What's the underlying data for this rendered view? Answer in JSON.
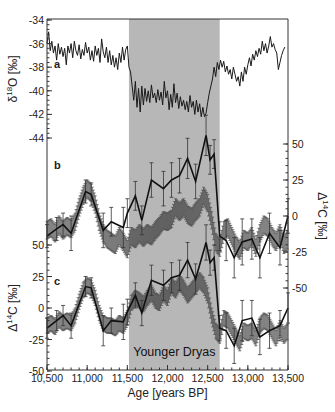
{
  "chart_data": {
    "type": "line",
    "title": "",
    "xlabel": "Age [years BP]",
    "xlim": [
      10500,
      13500
    ],
    "x_ticks": [
      10500,
      11000,
      11500,
      12000,
      12500,
      13000,
      13500
    ],
    "x_tick_labels": [
      "10,500",
      "11,000",
      "11,500",
      "12,000",
      "12,500",
      "13,000",
      "13,500"
    ],
    "shaded_region": {
      "label": "Younger Dryas",
      "x_range": [
        11520,
        12650
      ],
      "color": "#b7b7b7"
    },
    "panels": [
      {
        "id": "a",
        "label": "a",
        "ylabel_prefix": "δ",
        "ylabel_sup": "18",
        "ylabel_suffix": "O [‰]",
        "axis_side": "left",
        "ylim": [
          -44,
          -34
        ],
        "y_ticks": [
          -34,
          -36,
          -38,
          -40,
          -42,
          -44
        ],
        "series": [
          {
            "name": "delta18O",
            "color": "#1a1a1a",
            "x": [
              10500,
              10520,
              10540,
              10560,
              10580,
              10600,
              10620,
              10640,
              10660,
              10680,
              10700,
              10720,
              10740,
              10760,
              10780,
              10800,
              10820,
              10840,
              10860,
              10880,
              10900,
              10920,
              10940,
              10960,
              10980,
              11000,
              11020,
              11040,
              11060,
              11080,
              11100,
              11120,
              11140,
              11160,
              11180,
              11200,
              11220,
              11240,
              11260,
              11280,
              11300,
              11320,
              11340,
              11360,
              11380,
              11400,
              11420,
              11440,
              11460,
              11480,
              11500,
              11520,
              11540,
              11560,
              11580,
              11600,
              11620,
              11640,
              11660,
              11680,
              11700,
              11720,
              11740,
              11760,
              11780,
              11800,
              11820,
              11840,
              11860,
              11880,
              11900,
              11920,
              11940,
              11960,
              11980,
              12000,
              12020,
              12040,
              12060,
              12080,
              12100,
              12120,
              12140,
              12160,
              12180,
              12200,
              12220,
              12240,
              12260,
              12280,
              12300,
              12320,
              12340,
              12360,
              12380,
              12400,
              12420,
              12440,
              12460,
              12480,
              12500,
              12520,
              12540,
              12560,
              12580,
              12600,
              12620,
              12640,
              12660,
              12680,
              12700,
              12720,
              12740,
              12760,
              12780,
              12800,
              12820,
              12840,
              12860,
              12880,
              12900,
              12920,
              12940,
              12960,
              12980,
              13000,
              13020,
              13040,
              13060,
              13080,
              13100,
              13120,
              13140,
              13160,
              13180,
              13200,
              13220,
              13240,
              13260,
              13280,
              13300,
              13320,
              13340,
              13360,
              13380,
              13400,
              13420,
              13440,
              13460,
              13480,
              13500
            ],
            "values": [
              -36.0,
              -35.0,
              -36.6,
              -35.8,
              -36.8,
              -36.2,
              -37.4,
              -36.0,
              -36.9,
              -36.3,
              -37.1,
              -36.4,
              -37.8,
              -36.2,
              -36.8,
              -36.0,
              -37.2,
              -35.8,
              -36.6,
              -37.0,
              -36.1,
              -37.3,
              -36.5,
              -37.0,
              -35.9,
              -36.8,
              -36.3,
              -37.4,
              -36.6,
              -37.5,
              -36.2,
              -37.0,
              -36.4,
              -37.6,
              -35.6,
              -36.7,
              -37.2,
              -36.3,
              -37.6,
              -36.6,
              -37.8,
              -37.0,
              -38.0,
              -37.2,
              -38.2,
              -36.8,
              -37.6,
              -36.3,
              -37.4,
              -36.5,
              -36.2,
              -38.0,
              -38.4,
              -39.6,
              -40.8,
              -39.2,
              -41.4,
              -39.8,
              -41.8,
              -39.6,
              -41.2,
              -39.8,
              -40.9,
              -40.0,
              -41.0,
              -39.5,
              -40.6,
              -40.2,
              -41.0,
              -39.9,
              -40.8,
              -40.1,
              -41.2,
              -39.2,
              -40.6,
              -40.0,
              -41.6,
              -40.3,
              -41.4,
              -39.4,
              -41.0,
              -40.2,
              -41.5,
              -40.5,
              -41.3,
              -40.8,
              -41.6,
              -40.9,
              -41.8,
              -40.4,
              -41.4,
              -40.9,
              -42.0,
              -40.8,
              -41.8,
              -41.1,
              -42.2,
              -41.4,
              -42.2,
              -41.9,
              -41.0,
              -40.2,
              -39.6,
              -39.0,
              -38.0,
              -38.8,
              -37.6,
              -38.2,
              -37.4,
              -38.0,
              -37.5,
              -38.4,
              -37.9,
              -38.6,
              -38.2,
              -39.0,
              -38.0,
              -38.6,
              -39.2,
              -38.8,
              -39.6,
              -38.4,
              -39.2,
              -38.0,
              -38.6,
              -37.8,
              -37.2,
              -37.9,
              -36.9,
              -37.4,
              -36.6,
              -37.1,
              -36.4,
              -36.9,
              -35.8,
              -36.6,
              -36.0,
              -36.8,
              -36.2,
              -35.4,
              -36.3,
              -36.0,
              -36.5,
              -36.8,
              -38.2,
              -37.6,
              -37.0,
              -36.6,
              -36.3
            ]
          }
        ]
      },
      {
        "id": "b",
        "label": "b",
        "ylabel_prefix": "Δ",
        "ylabel_sup": "14",
        "ylabel_suffix": "C [‰]",
        "axis_side": "right",
        "ylim": [
          -50,
          50
        ],
        "y_ticks": [
          50,
          25,
          0,
          -25,
          -50
        ],
        "series": [
          {
            "name": "model-band",
            "style": "dense-error-band",
            "color": "#555555",
            "x": [
              10500,
              10550,
              10600,
              10650,
              10700,
              10750,
              10800,
              10850,
              10900,
              10950,
              11000,
              11050,
              11100,
              11150,
              11200,
              11250,
              11300,
              11350,
              11400,
              11450,
              11500,
              11550,
              11600,
              11650,
              11700,
              11750,
              11800,
              11850,
              11900,
              11950,
              12000,
              12050,
              12100,
              12150,
              12200,
              12250,
              12300,
              12350,
              12400,
              12450,
              12500,
              12550,
              12600,
              12650,
              12700,
              12750,
              12800,
              12850,
              12900,
              12950,
              13000,
              13050,
              13100,
              13150,
              13200,
              13250,
              13300,
              13350,
              13400,
              13450,
              13500
            ],
            "values": [
              -10,
              -8,
              -12,
              -6,
              -10,
              -7,
              -9,
              -4,
              6,
              14,
              19,
              16,
              8,
              -4,
              -12,
              -16,
              -18,
              -20,
              -14,
              -18,
              -23,
              -14,
              -16,
              -12,
              -15,
              -12,
              -14,
              -10,
              -7,
              -3,
              -4,
              -2,
              6,
              3,
              6,
              1,
              -1,
              3,
              6,
              14,
              9,
              -3,
              -18,
              -22,
              -10,
              -8,
              -14,
              -20,
              -24,
              -16,
              -18,
              -14,
              -22,
              -12,
              -6,
              -8,
              -14,
              -18,
              -12,
              -20,
              -16
            ],
            "errors": [
              6,
              6,
              6,
              6,
              6,
              6,
              6,
              6,
              6,
              6,
              6,
              6,
              6,
              6,
              6,
              6,
              6,
              6,
              6,
              6,
              6,
              6,
              6,
              6,
              6,
              6,
              6,
              6,
              6,
              6,
              6,
              6,
              6,
              6,
              6,
              6,
              6,
              6,
              6,
              6,
              6,
              6,
              6,
              6,
              6,
              6,
              6,
              6,
              6,
              6,
              6,
              6,
              6,
              6,
              6,
              6,
              6,
              6,
              6,
              6,
              6
            ]
          },
          {
            "name": "measured",
            "style": "line-with-errorbars",
            "color": "#111111",
            "x": [
              10500,
              10620,
              10700,
              10800,
              10980,
              11050,
              11200,
              11300,
              11450,
              11500,
              11600,
              11680,
              11800,
              11950,
              12050,
              12150,
              12250,
              12350,
              12480,
              12530,
              12580,
              12650,
              12730,
              12830,
              12930,
              13050,
              13150,
              13270,
              13400,
              13500
            ],
            "values": [
              -14,
              -9,
              -6,
              -12,
              17,
              15,
              -10,
              -4,
              -8,
              2,
              14,
              -3,
              25,
              19,
              25,
              28,
              40,
              24,
              56,
              39,
              43,
              -14,
              -17,
              -29,
              -18,
              -16,
              -29,
              -12,
              -22,
              0
            ],
            "errors": [
              8,
              8,
              8,
              12,
              8,
              8,
              12,
              10,
              14,
              10,
              10,
              10,
              12,
              12,
              12,
              12,
              14,
              12,
              14,
              10,
              10,
              10,
              14,
              14,
              16,
              14,
              14,
              14,
              12,
              12
            ]
          }
        ]
      },
      {
        "id": "c",
        "label": "c",
        "ylabel_prefix": "Δ",
        "ylabel_sup": "14",
        "ylabel_suffix": "C [‰]",
        "axis_side": "left",
        "ylim": [
          -50,
          50
        ],
        "y_ticks": [
          50,
          25,
          0,
          -25,
          -50
        ],
        "series": [
          {
            "name": "model-band",
            "style": "dense-error-band",
            "color": "#555555",
            "x": [
              10500,
              10550,
              10600,
              10650,
              10700,
              10750,
              10800,
              10850,
              10900,
              10950,
              11000,
              11050,
              11100,
              11150,
              11200,
              11250,
              11300,
              11350,
              11400,
              11450,
              11500,
              11550,
              11600,
              11650,
              11700,
              11750,
              11800,
              11850,
              11900,
              11950,
              12000,
              12050,
              12100,
              12150,
              12200,
              12250,
              12300,
              12350,
              12400,
              12450,
              12500,
              12550,
              12600,
              12650,
              12700,
              12750,
              12800,
              12850,
              12900,
              12950,
              13000,
              13050,
              13100,
              13150,
              13200,
              13250,
              13300,
              13350,
              13400,
              13450,
              13500
            ],
            "values": [
              -14,
              -12,
              -15,
              -9,
              -12,
              -10,
              -12,
              -6,
              5,
              14,
              18,
              16,
              8,
              -4,
              -12,
              -14,
              -14,
              -16,
              -12,
              -14,
              -8,
              4,
              8,
              6,
              3,
              8,
              12,
              6,
              4,
              12,
              8,
              18,
              14,
              20,
              16,
              10,
              14,
              18,
              22,
              18,
              10,
              -6,
              -18,
              -22,
              -8,
              -10,
              -16,
              -22,
              -28,
              -18,
              -20,
              -18,
              -24,
              -14,
              -10,
              -12,
              -18,
              -24,
              -16,
              -22,
              -18
            ],
            "errors": [
              6,
              6,
              6,
              6,
              6,
              6,
              6,
              6,
              6,
              6,
              6,
              6,
              6,
              6,
              6,
              6,
              6,
              6,
              6,
              6,
              6,
              6,
              6,
              6,
              6,
              6,
              6,
              6,
              6,
              6,
              6,
              6,
              6,
              6,
              6,
              6,
              6,
              6,
              6,
              6,
              6,
              6,
              6,
              6,
              6,
              6,
              6,
              6,
              6,
              6,
              6,
              6,
              6,
              6,
              6,
              6,
              6,
              6,
              6,
              6,
              6
            ]
          },
          {
            "name": "measured",
            "style": "line-with-errorbars",
            "color": "#111111",
            "x": [
              10500,
              10620,
              10700,
              10800,
              10980,
              11050,
              11200,
              11300,
              11450,
              11500,
              11600,
              11680,
              11800,
              11950,
              12050,
              12150,
              12250,
              12350,
              12480,
              12530,
              12580,
              12650,
              12730,
              12830,
              12930,
              13050,
              13150,
              13270,
              13400,
              13500
            ],
            "values": [
              -16,
              -10,
              -6,
              -14,
              17,
              16,
              -18,
              -10,
              -11,
              -3,
              10,
              -4,
              22,
              18,
              24,
              26,
              38,
              23,
              52,
              36,
              40,
              -16,
              -18,
              -30,
              -10,
              -8,
              -23,
              -18,
              -14,
              0
            ],
            "errors": [
              8,
              8,
              8,
              10,
              8,
              8,
              12,
              10,
              14,
              10,
              10,
              10,
              12,
              12,
              12,
              12,
              14,
              12,
              14,
              10,
              10,
              10,
              14,
              14,
              16,
              14,
              14,
              14,
              12,
              12
            ]
          }
        ]
      }
    ]
  }
}
